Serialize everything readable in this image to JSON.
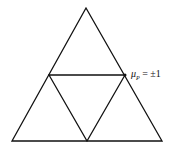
{
  "diagram": {
    "type": "subdivided-triangle",
    "outer_triangle": {
      "apex": [
        86,
        8
      ],
      "left": [
        12,
        141
      ],
      "right": [
        162,
        141
      ]
    },
    "inner_triangle": {
      "left": [
        49,
        75
      ],
      "right": [
        125,
        75
      ],
      "bottom": [
        87,
        141
      ]
    },
    "label": {
      "symbol": "μ",
      "subscript": "P",
      "text": " = ±1"
    },
    "stroke_color": "#111111"
  }
}
